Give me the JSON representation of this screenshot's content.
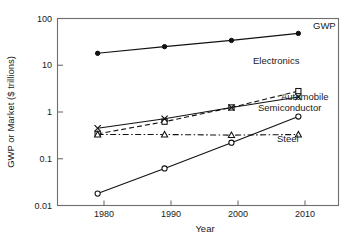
{
  "chart_data": {
    "type": "line",
    "title": "",
    "xlabel": "Year",
    "ylabel": "GWP or Market ($ trillions)",
    "x": [
      1980,
      1990,
      2000,
      2010
    ],
    "xtick_labels": [
      "1980",
      "1990",
      "2000",
      "2010"
    ],
    "ytick_labels": [
      "100",
      "10",
      "1",
      "0.1",
      "0.01"
    ],
    "ytick_values": [
      100,
      10,
      1,
      0.1,
      0.01
    ],
    "yscale": "log",
    "ylim": [
      0.01,
      100
    ],
    "xlim": [
      1974,
      2016
    ],
    "grid": false,
    "legend_position": "inline-right-labels",
    "series": [
      {
        "name": "GWP",
        "label": "GWP",
        "marker": "filled-circle",
        "linestyle": "solid",
        "values": [
          18,
          25,
          34,
          48
        ]
      },
      {
        "name": "Electronics",
        "label": "Electronics",
        "marker": "open-square",
        "linestyle": "dashed",
        "values": [
          0.34,
          0.62,
          1.25,
          2.8
        ]
      },
      {
        "name": "Automobile",
        "label": "Automobile",
        "marker": "cross",
        "linestyle": "solid",
        "values": [
          0.45,
          0.72,
          1.25,
          2.1
        ]
      },
      {
        "name": "Semiconductor",
        "label": "Semiconductor",
        "marker": "open-circle",
        "linestyle": "solid",
        "values": [
          0.018,
          0.062,
          0.22,
          0.8
        ]
      },
      {
        "name": "Steel",
        "label": "Steel",
        "marker": "open-triangle",
        "linestyle": "dash-dot",
        "values": [
          0.33,
          0.33,
          0.32,
          0.33
        ]
      }
    ],
    "colors": {
      "line": "#111111",
      "frame": "#6e6e6e",
      "text": "#1a1a1a",
      "background": "#ffffff"
    }
  },
  "labels": {
    "gwp": "GWP",
    "electronics": "Electronics",
    "automobile": "Automobile",
    "semiconductor": "Semiconductor",
    "steel": "Steel"
  },
  "axes": {
    "x_title": "Year",
    "y_title": "GWP or Market ($ trillions)",
    "x_ticks": [
      "1980",
      "1990",
      "2000",
      "2010"
    ],
    "y_ticks": [
      "100",
      "10",
      "1",
      "0.1",
      "0.01"
    ]
  }
}
